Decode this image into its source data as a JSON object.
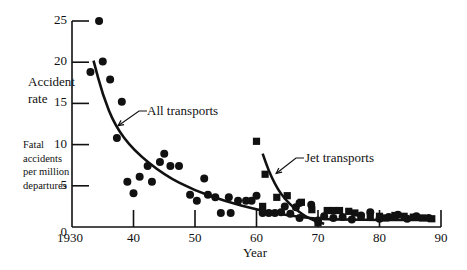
{
  "chart_data": {
    "type": "scatter",
    "title": "",
    "xlabel": "Year",
    "ylabel": "Accident rate",
    "ylabel_sub": [
      "Fatal",
      "accidents",
      "per million",
      "departures"
    ],
    "xlim": [
      1930,
      1990
    ],
    "ylim": [
      0,
      25
    ],
    "x_ticks": [
      "1930",
      "40",
      "50",
      "60",
      "70",
      "80",
      "90"
    ],
    "x_tick_values": [
      1930,
      1940,
      1950,
      1960,
      1970,
      1980,
      1990
    ],
    "y_ticks": [
      "0",
      "5",
      "10",
      "15",
      "20",
      "25"
    ],
    "y_tick_values": [
      0,
      5,
      10,
      15,
      20,
      25
    ],
    "grid": false,
    "legend": "none (curves annotated inline)",
    "series": [
      {
        "name": "All transports",
        "marker": "circle",
        "points": [
          [
            1933.0,
            18.8
          ],
          [
            1934.4,
            25.0
          ],
          [
            1935.0,
            20.1
          ],
          [
            1936.2,
            17.9
          ],
          [
            1937.3,
            10.8
          ],
          [
            1938.1,
            15.2
          ],
          [
            1939.0,
            5.5
          ],
          [
            1940.0,
            4.1
          ],
          [
            1941.0,
            6.1
          ],
          [
            1942.3,
            7.4
          ],
          [
            1943.0,
            5.5
          ],
          [
            1944.3,
            7.9
          ],
          [
            1945.0,
            8.9
          ],
          [
            1946.0,
            7.4
          ],
          [
            1947.4,
            7.4
          ],
          [
            1949.2,
            3.9
          ],
          [
            1950.3,
            3.2
          ],
          [
            1951.5,
            5.9
          ],
          [
            1952.1,
            3.9
          ],
          [
            1953.3,
            3.6
          ],
          [
            1954.2,
            1.7
          ],
          [
            1955.5,
            3.6
          ],
          [
            1955.8,
            1.7
          ],
          [
            1957.0,
            3.2
          ],
          [
            1958.3,
            3.2
          ],
          [
            1959.2,
            3.2
          ],
          [
            1960.0,
            3.8
          ],
          [
            1961.0,
            1.7
          ],
          [
            1962.0,
            1.7
          ],
          [
            1963.0,
            1.7
          ],
          [
            1964.0,
            1.8
          ],
          [
            1964.6,
            2.5
          ],
          [
            1965.5,
            1.6
          ],
          [
            1966.4,
            2.4
          ],
          [
            1967.0,
            2.9
          ],
          [
            1967.0,
            1.1
          ],
          [
            1968.9,
            2.7
          ],
          [
            1970.0,
            0.8
          ],
          [
            1971.0,
            1.3
          ],
          [
            1972.5,
            1.1
          ],
          [
            1974.0,
            1.2
          ],
          [
            1975.5,
            0.9
          ],
          [
            1977.0,
            1.4
          ],
          [
            1978.5,
            1.8
          ],
          [
            1980.0,
            1.0
          ],
          [
            1981.5,
            1.2
          ],
          [
            1983.0,
            1.5
          ],
          [
            1984.5,
            1.0
          ],
          [
            1986.0,
            1.3
          ],
          [
            1988.0,
            1.1
          ]
        ],
        "trend_curve": [
          [
            1933.5,
            20.2
          ],
          [
            1935,
            16.0
          ],
          [
            1937,
            12.3
          ],
          [
            1940,
            9.3
          ],
          [
            1945,
            6.3
          ],
          [
            1950,
            4.4
          ],
          [
            1955,
            3.1
          ],
          [
            1960,
            2.1
          ],
          [
            1965,
            1.4
          ],
          [
            1970,
            0.95
          ],
          [
            1975,
            0.9
          ],
          [
            1980,
            0.85
          ],
          [
            1985,
            0.85
          ],
          [
            1989,
            0.85
          ]
        ]
      },
      {
        "name": "Jet transports",
        "marker": "square",
        "points": [
          [
            1960.0,
            10.4
          ],
          [
            1961.4,
            6.4
          ],
          [
            1961.0,
            2.5
          ],
          [
            1963.3,
            3.6
          ],
          [
            1965.0,
            3.8
          ],
          [
            1967.3,
            3.0
          ],
          [
            1969.0,
            2.1
          ],
          [
            1970.0,
            0.5
          ],
          [
            1971.5,
            2.0
          ],
          [
            1972.5,
            2.0
          ],
          [
            1973.5,
            2.0
          ],
          [
            1975.0,
            1.9
          ],
          [
            1976.0,
            1.7
          ],
          [
            1977.0,
            1.2
          ],
          [
            1978.5,
            1.2
          ],
          [
            1980.0,
            1.3
          ],
          [
            1981.0,
            1.1
          ],
          [
            1982.5,
            1.4
          ],
          [
            1984.0,
            1.3
          ],
          [
            1985.5,
            1.2
          ],
          [
            1987.0,
            1.1
          ],
          [
            1988.5,
            1.0
          ]
        ],
        "trend_curve": [
          [
            1961.0,
            8.9
          ],
          [
            1962,
            6.8
          ],
          [
            1963,
            5.2
          ],
          [
            1964,
            4.0
          ],
          [
            1965,
            3.1
          ],
          [
            1966,
            2.4
          ],
          [
            1967,
            1.8
          ],
          [
            1968,
            1.3
          ],
          [
            1969,
            0.9
          ],
          [
            1970,
            0.6
          ],
          [
            1971,
            0.4
          ]
        ]
      }
    ],
    "annotations": [
      {
        "text": "All transports",
        "arrow_to": [
          1937.5,
          12.3
        ]
      },
      {
        "text": "Jet transports",
        "arrow_to": [
          1963.2,
          6.5
        ]
      }
    ]
  },
  "labels": {
    "ylabel_line1": "Accident",
    "ylabel_line2": "rate",
    "sub1": "Fatal",
    "sub2": "accidents",
    "sub3": "per million",
    "sub4": "departures",
    "xlabel": "Year",
    "all_transports": "All transports",
    "jet_transports": "Jet transports"
  }
}
